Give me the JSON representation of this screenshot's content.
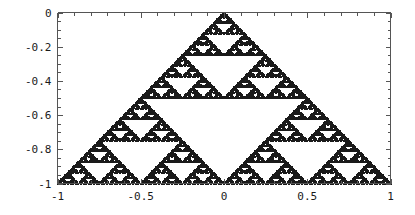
{
  "figure": {
    "name": "sierpinski-triangle-plot",
    "background_color": "#ffffff",
    "frame_color": "#555555",
    "point_color": "#1a1a1a",
    "title": "",
    "subtitle": ""
  },
  "chart_data": {
    "type": "scatter",
    "title": "",
    "xlabel": "",
    "ylabel": "",
    "xlim": [
      -1,
      1
    ],
    "ylim": [
      -1,
      0
    ],
    "grid": false,
    "legend": null,
    "marker": "square",
    "marker_size_px": 2,
    "point_color": "#1a1a1a",
    "vertices": [
      [
        -1,
        -1
      ],
      [
        1,
        -1
      ],
      [
        0,
        0
      ]
    ],
    "iterations": 7,
    "x_ticks": [
      -1,
      -0.5,
      0,
      0.5,
      1
    ],
    "x_tick_labels": [
      "-1",
      "-0.5",
      "0",
      "0.5",
      "1"
    ],
    "y_ticks": [
      0,
      -0.2,
      -0.4,
      -0.6,
      -0.8,
      -1
    ],
    "y_tick_labels": [
      "0",
      "-0.2",
      "-0.4",
      "-0.6",
      "-0.8",
      "-1"
    ],
    "x_minor_tick_step": 0.1,
    "y_minor_tick_step": 0.05,
    "frame": true
  },
  "axes": {
    "x_tick_labels": [
      "-1",
      "-0.5",
      "0",
      "0.5",
      "1"
    ],
    "y_tick_labels": [
      "0",
      "-0.2",
      "-0.4",
      "-0.6",
      "-0.8",
      "-1"
    ]
  }
}
